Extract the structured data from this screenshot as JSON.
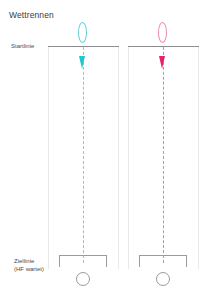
{
  "diagram": {
    "title": "Wettrennen",
    "labels": {
      "start_line": "Startlinie",
      "finish_line_line1": "Ziellinie",
      "finish_line_line2": "(HF wartet)"
    },
    "colors": {
      "background": "#ffffff",
      "title_text": "#3a3a3a",
      "label_text": "#4a4a4a",
      "start_line": "#8d8d92",
      "rail": "#e9e9ec",
      "gate": "#9a9a9f",
      "lane_1_accent": "#21c7cf",
      "lane_1_accent_light": "#6fd4d8",
      "lane_2_accent": "#e8216b",
      "lane_2_accent_light": "#f07a9c"
    },
    "lanes": [
      {
        "id": "lane-1",
        "name": "linke Bahn",
        "accent": "#21c7cf",
        "runner_marker": "oval-outline",
        "position_marker": "downward-pointer",
        "center_line_style": "dashed"
      },
      {
        "id": "lane-2",
        "name": "rechte Bahn",
        "accent": "#e8216b",
        "runner_marker": "oval-outline",
        "position_marker": "downward-pointer",
        "center_line_style": "dashed"
      }
    ]
  }
}
